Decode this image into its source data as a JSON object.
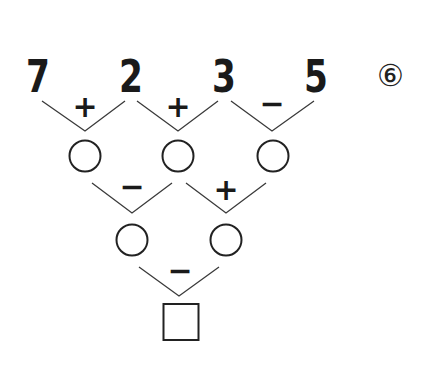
{
  "problem": {
    "label": "⑥",
    "top_numbers": [
      "7",
      "2",
      "3",
      "5"
    ],
    "row1_operators": [
      "+",
      "+",
      "−"
    ],
    "row2_operators": [
      "−",
      "+"
    ],
    "row3_operators": [
      "−"
    ],
    "row1_slots": [
      "",
      "",
      ""
    ],
    "row2_slots": [
      "",
      ""
    ],
    "answer_slot": ""
  }
}
